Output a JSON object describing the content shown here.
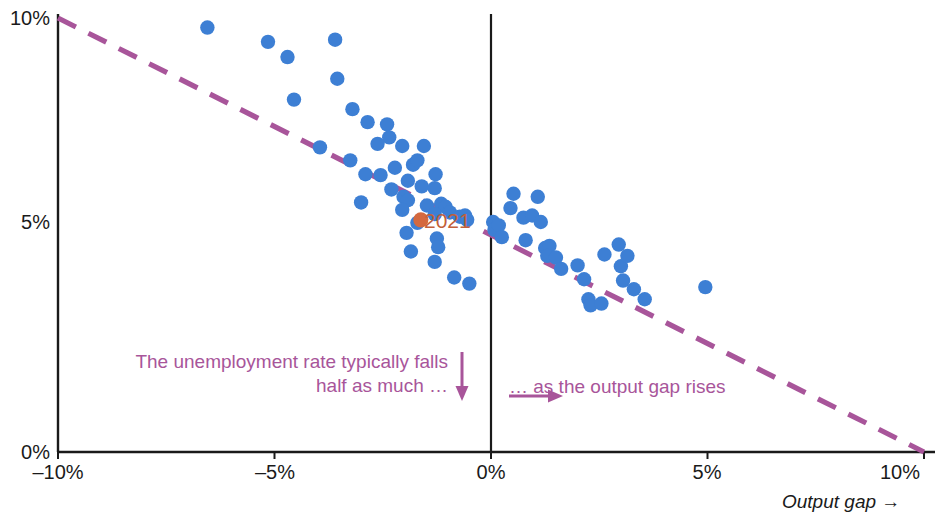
{
  "chart_data": {
    "type": "scatter",
    "title": "",
    "subtitle": "",
    "xlabel": "Output gap →",
    "ylabel": "",
    "xlim": [
      -10,
      10
    ],
    "ylim": [
      0,
      10
    ],
    "grid": false,
    "legend_position": "none",
    "x_ticks": [
      {
        "value": -10,
        "label": "–10%"
      },
      {
        "value": -5,
        "label": "–5%"
      },
      {
        "value": 0,
        "label": "0%"
      },
      {
        "value": 5,
        "label": "5%"
      },
      {
        "value": 10,
        "label": "10%"
      }
    ],
    "y_ticks": [
      {
        "value": 0,
        "label": "0%"
      },
      {
        "value": 5,
        "label": "5%"
      },
      {
        "value": 10,
        "label": "10%"
      }
    ],
    "zero_line_x": 0,
    "trendline": {
      "label": "",
      "style": "dashed",
      "color": "#a8559a",
      "x_start": -10,
      "y_start": 10,
      "x_end": 10,
      "y_end": 0,
      "slope": -0.5,
      "intercept": 5
    },
    "series": [
      {
        "name": "Annual observations",
        "color": "#3d7fd4",
        "marker": "circle",
        "points": [
          [
            -6.55,
            9.78
          ],
          [
            -5.15,
            9.45
          ],
          [
            -4.7,
            9.1
          ],
          [
            -3.6,
            9.5
          ],
          [
            -3.55,
            8.6
          ],
          [
            -4.55,
            8.12
          ],
          [
            -3.2,
            7.9
          ],
          [
            -2.85,
            7.6
          ],
          [
            -2.4,
            7.55
          ],
          [
            -2.35,
            7.25
          ],
          [
            -2.62,
            7.1
          ],
          [
            -2.05,
            7.05
          ],
          [
            -1.55,
            7.05
          ],
          [
            -3.95,
            7.02
          ],
          [
            -3.25,
            6.72
          ],
          [
            -2.9,
            6.4
          ],
          [
            -2.55,
            6.38
          ],
          [
            -2.22,
            6.55
          ],
          [
            -1.8,
            6.62
          ],
          [
            -1.7,
            6.72
          ],
          [
            -1.92,
            6.25
          ],
          [
            -2.3,
            6.05
          ],
          [
            -1.6,
            6.12
          ],
          [
            -1.28,
            6.4
          ],
          [
            -1.3,
            6.08
          ],
          [
            -2.02,
            5.88
          ],
          [
            -1.92,
            5.8
          ],
          [
            -3.0,
            5.75
          ],
          [
            -2.05,
            5.58
          ],
          [
            -1.48,
            5.68
          ],
          [
            -1.15,
            5.72
          ],
          [
            -1.05,
            5.65
          ],
          [
            -1.3,
            5.48
          ],
          [
            -0.95,
            5.52
          ],
          [
            -0.72,
            5.42
          ],
          [
            -0.6,
            5.45
          ],
          [
            -0.55,
            5.35
          ],
          [
            -1.7,
            5.28
          ],
          [
            -1.95,
            5.05
          ],
          [
            -1.25,
            4.92
          ],
          [
            -1.22,
            4.72
          ],
          [
            -1.85,
            4.62
          ],
          [
            -1.3,
            4.38
          ],
          [
            -0.85,
            4.02
          ],
          [
            -0.5,
            3.88
          ],
          [
            0.05,
            5.3
          ],
          [
            0.08,
            5.12
          ],
          [
            0.18,
            5.22
          ],
          [
            0.25,
            4.95
          ],
          [
            0.45,
            5.62
          ],
          [
            0.52,
            5.95
          ],
          [
            0.75,
            5.4
          ],
          [
            0.8,
            4.88
          ],
          [
            0.95,
            5.45
          ],
          [
            1.08,
            5.88
          ],
          [
            1.15,
            5.3
          ],
          [
            1.25,
            4.7
          ],
          [
            1.35,
            4.75
          ],
          [
            1.3,
            4.52
          ],
          [
            1.5,
            4.48
          ],
          [
            1.62,
            4.22
          ],
          [
            2.0,
            4.3
          ],
          [
            2.15,
            3.98
          ],
          [
            2.25,
            3.52
          ],
          [
            2.3,
            3.38
          ],
          [
            2.55,
            3.42
          ],
          [
            2.62,
            4.55
          ],
          [
            2.95,
            4.78
          ],
          [
            3.0,
            4.28
          ],
          [
            3.05,
            3.95
          ],
          [
            3.15,
            4.52
          ],
          [
            3.3,
            3.75
          ],
          [
            3.55,
            3.52
          ],
          [
            4.95,
            3.8
          ]
        ]
      }
    ],
    "highlights": [
      {
        "label": "2021",
        "x": -1.62,
        "y": 5.35,
        "color": "#d4693f",
        "label_color": "#c2603a"
      }
    ],
    "annotations": [
      {
        "id": "left-annotation",
        "line1": "The unemployment rate typically falls",
        "line2": "half as much …",
        "color": "#a8559a",
        "arrow": "down"
      },
      {
        "id": "right-annotation",
        "line1": "… as the output gap rises",
        "color": "#a8559a",
        "arrow": "right"
      }
    ]
  },
  "axes": {
    "x_title": "Output gap →",
    "y_tick_0": "0%",
    "y_tick_5": "5%",
    "y_tick_10": "10%",
    "x_tick_neg10": "–10%",
    "x_tick_neg5": "–5%",
    "x_tick_0": "0%",
    "x_tick_5": "5%",
    "x_tick_10": "10%"
  },
  "annotations": {
    "left_line1": "The unemployment rate typically falls",
    "left_line2": "half as much …",
    "right_line1": "… as the output gap rises",
    "highlight_label": "2021"
  },
  "colors": {
    "point": "#3d7fd4",
    "highlight": "#d4693f",
    "trendline": "#a8559a",
    "annotation": "#a8559a",
    "axis": "#1a1a1a"
  }
}
